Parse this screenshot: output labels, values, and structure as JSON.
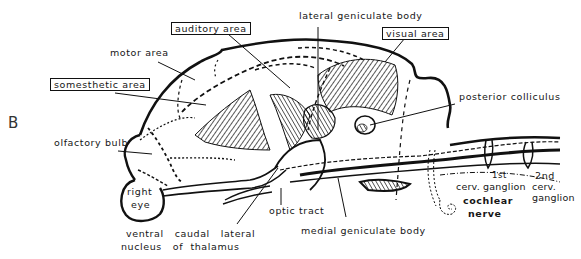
{
  "figure": {
    "panel_letter": "B",
    "labels": {
      "auditory_area": "auditory area",
      "lateral_geniculate_body": "lateral geniculate body",
      "visual_area": "visual area",
      "motor_area": "motor area",
      "somesthetic_area": "somesthetic area",
      "posterior_colliculus": "posterior colliculus",
      "olfactory_bulb": "olfactory bulb",
      "right_eye_line1": "right",
      "right_eye_line2": "eye",
      "optic_tract": "optic tract",
      "thalamus_line1": "ventral   caudal   lateral",
      "thalamus_line2": "nucleus   of  thalamus",
      "medial_geniculate_body": "medial geniculate body",
      "first_ganglion_ord": "1st",
      "first_ganglion": "cerv. ganglion",
      "second_ganglion_ord": "2nd",
      "second_ganglion_line1": "cerv.",
      "second_ganglion_line2": "ganglion",
      "cochlear_line1": "cochlear",
      "cochlear_line2": "nerve"
    },
    "boxed_labels": [
      "auditory area",
      "visual area",
      "somesthetic area"
    ]
  }
}
